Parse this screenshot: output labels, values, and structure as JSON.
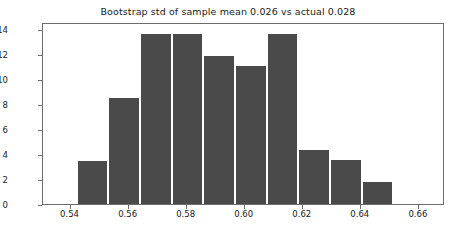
{
  "chart_data": {
    "type": "bar",
    "title": "Bootstrap std of sample mean 0.026 vs actual 0.028",
    "xlabel": "",
    "ylabel": "",
    "grid": false,
    "legend": "none",
    "orientation": "vertical",
    "bar_color": "#4a4a4a",
    "axes_color": "#6b6b6b",
    "background": "#ffffff",
    "xlim": [
      0.5305,
      0.669
    ],
    "ylim": [
      0,
      14.55
    ],
    "xticks": [
      0.54,
      0.56,
      0.58,
      0.6,
      0.62,
      0.64,
      0.66
    ],
    "xtick_labels": [
      "0.54",
      "0.56",
      "0.58",
      "0.60",
      "0.62",
      "0.64",
      "0.66"
    ],
    "yticks": [
      0,
      2,
      4,
      6,
      8,
      10,
      12,
      14
    ],
    "ytick_labels": [
      "0",
      "2",
      "4",
      "6",
      "8",
      "10",
      "12",
      "14"
    ],
    "bin_edges": [
      0.5425,
      0.5534,
      0.5643,
      0.5752,
      0.5861,
      0.597,
      0.6079,
      0.6188,
      0.6297,
      0.6406,
      0.6515,
      0.6624
    ],
    "bin_centers": [
      0.548,
      0.5589,
      0.5698,
      0.5807,
      0.5916,
      0.6025,
      0.6134,
      0.6243,
      0.6352,
      0.6461,
      0.657
    ],
    "values": [
      3.4,
      8.5,
      13.6,
      13.6,
      11.8,
      11.0,
      13.6,
      4.3,
      3.5,
      1.8,
      0.0
    ],
    "bars": [
      {
        "left": 0.5425,
        "right": 0.5534,
        "height": 3.4
      },
      {
        "left": 0.5534,
        "right": 0.5643,
        "height": 8.5
      },
      {
        "left": 0.5643,
        "right": 0.5752,
        "height": 13.6
      },
      {
        "left": 0.5752,
        "right": 0.5861,
        "height": 13.6
      },
      {
        "left": 0.5861,
        "right": 0.597,
        "height": 11.8
      },
      {
        "left": 0.597,
        "right": 0.6079,
        "height": 11.0
      },
      {
        "left": 0.6079,
        "right": 0.6188,
        "height": 13.6
      },
      {
        "left": 0.6188,
        "right": 0.6297,
        "height": 4.3
      },
      {
        "left": 0.6297,
        "right": 0.6406,
        "height": 3.5
      },
      {
        "left": 0.6406,
        "right": 0.6515,
        "height": 1.8
      }
    ],
    "annotations": {
      "bootstrap_std": "0.026",
      "actual_std": "0.028"
    }
  }
}
